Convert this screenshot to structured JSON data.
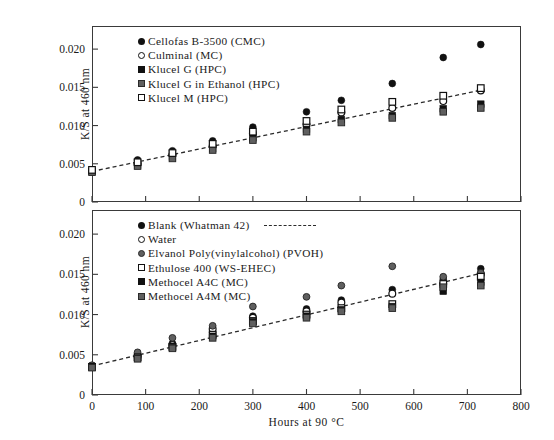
{
  "chart_data": [
    {
      "type": "scatter",
      "panel": "top",
      "title": "",
      "xlabel": "",
      "ylabel": "K/S at 460 nm",
      "xlim": [
        0,
        800
      ],
      "ylim": [
        0,
        0.0225
      ],
      "xticks": [
        0,
        100,
        200,
        300,
        400,
        500,
        600,
        700,
        800
      ],
      "xticklabels": [
        "0",
        "100",
        "200",
        "300",
        "400",
        "500",
        "600",
        "700",
        "800"
      ],
      "yticks": [
        0,
        0.005,
        0.01,
        0.015,
        0.02
      ],
      "yticklabels": [
        "0",
        "0.005",
        "0.010",
        "0.015",
        "0.020"
      ],
      "grid": false,
      "legend_position": "top-left",
      "trendline": {
        "style": "dashed",
        "x": [
          0,
          730
        ],
        "y": [
          0.004,
          0.0147
        ]
      },
      "x": [
        0,
        85,
        150,
        225,
        300,
        400,
        465,
        560,
        655,
        725
      ],
      "series": [
        {
          "name": "Cellofas B-3500 (CMC)",
          "marker": "filled-circle",
          "values": [
            0.0042,
            0.0055,
            0.0067,
            0.008,
            0.0098,
            0.0118,
            0.0133,
            0.0155,
            0.0189,
            0.0206
          ]
        },
        {
          "name": "Culminal (MC)",
          "marker": "open-circle",
          "values": [
            0.0041,
            0.005,
            0.0062,
            0.0073,
            0.009,
            0.0101,
            0.0117,
            0.0123,
            0.0132,
            0.0146
          ]
        },
        {
          "name": "Klucel G (HPC)",
          "marker": "filled-square",
          "values": [
            0.004,
            0.0048,
            0.0059,
            0.007,
            0.0084,
            0.0095,
            0.0108,
            0.0113,
            0.0122,
            0.0128
          ]
        },
        {
          "name": "Klucel G in Ethanol (HPC)",
          "marker": "gray-square",
          "values": [
            0.0039,
            0.0047,
            0.0057,
            0.0068,
            0.0081,
            0.0092,
            0.0104,
            0.011,
            0.0118,
            0.0123
          ]
        },
        {
          "name": "Klucel M (HPC)",
          "marker": "open-square",
          "values": [
            0.0042,
            0.0052,
            0.0064,
            0.0076,
            0.0092,
            0.0106,
            0.0121,
            0.0131,
            0.0139,
            0.0149
          ]
        }
      ],
      "legend": [
        {
          "label": "Cellofas B-3500 (CMC)",
          "marker": "filled-circle"
        },
        {
          "label": "Culminal (MC)",
          "marker": "open-circle"
        },
        {
          "label": "Klucel G (HPC)",
          "marker": "filled-square"
        },
        {
          "label": "Klucel G in Ethanol (HPC)",
          "marker": "gray-square"
        },
        {
          "label": "Klucel M (HPC)",
          "marker": "open-square"
        }
      ]
    },
    {
      "type": "scatter",
      "panel": "bottom",
      "title": "",
      "xlabel": "Hours at 90 °C",
      "ylabel": "K/S at 460 nm",
      "xlim": [
        0,
        800
      ],
      "ylim": [
        0,
        0.0225
      ],
      "xticks": [
        0,
        100,
        200,
        300,
        400,
        500,
        600,
        700,
        800
      ],
      "xticklabels": [
        "0",
        "100",
        "200",
        "300",
        "400",
        "500",
        "600",
        "700",
        "800"
      ],
      "yticks": [
        0,
        0.005,
        0.01,
        0.015,
        0.02
      ],
      "yticklabels": [
        "0",
        "0.005",
        "0.010",
        "0.015",
        "0.020"
      ],
      "grid": false,
      "legend_position": "top-left",
      "trendline": {
        "style": "dashed",
        "x": [
          0,
          730
        ],
        "y": [
          0.0036,
          0.0152
        ]
      },
      "x": [
        0,
        85,
        150,
        225,
        300,
        400,
        465,
        560,
        655,
        725
      ],
      "series": [
        {
          "name": "Blank (Whatman 42)",
          "marker": "filled-circle",
          "values": [
            0.0036,
            0.0049,
            0.0064,
            0.0078,
            0.0098,
            0.0107,
            0.0118,
            0.0131,
            0.0144,
            0.0157
          ]
        },
        {
          "name": "Water",
          "marker": "open-circle",
          "values": [
            0.0036,
            0.0048,
            0.0062,
            0.0082,
            0.0096,
            0.0104,
            0.0115,
            0.0126,
            0.0138,
            0.015
          ]
        },
        {
          "name": "Elvanol Poly(vinylalcohol) (PVOH)",
          "marker": "gray-circle",
          "values": [
            0.0037,
            0.0053,
            0.0071,
            0.0086,
            0.011,
            0.0122,
            0.0136,
            0.016,
            0.0147,
            0.0152
          ]
        },
        {
          "name": "Ethulose 400 (WS-EHEC)",
          "marker": "open-square",
          "values": [
            0.0035,
            0.0047,
            0.006,
            0.0075,
            0.0092,
            0.01,
            0.0108,
            0.0113,
            0.0138,
            0.0147
          ]
        },
        {
          "name": "Methocel A4C (MC)",
          "marker": "filled-square",
          "values": [
            0.0035,
            0.0046,
            0.0059,
            0.0073,
            0.0091,
            0.0098,
            0.0106,
            0.011,
            0.0129,
            0.014
          ]
        },
        {
          "name": "Methocel A4M (MC)",
          "marker": "gray-square",
          "values": [
            0.0034,
            0.0045,
            0.0058,
            0.0071,
            0.0089,
            0.0096,
            0.0104,
            0.0108,
            0.0134,
            0.0136
          ]
        }
      ],
      "legend": [
        {
          "label": "Blank (Whatman 42)",
          "marker": "filled-circle",
          "dash": true
        },
        {
          "label": "Water",
          "marker": "open-circle"
        },
        {
          "label": "Elvanol Poly(vinylalcohol) (PVOH)",
          "marker": "gray-circle"
        },
        {
          "label": "Ethulose 400 (WS-EHEC)",
          "marker": "open-square"
        },
        {
          "label": "Methocel A4C (MC)",
          "marker": "filled-square"
        },
        {
          "label": "Methocel A4M (MC)",
          "marker": "gray-square"
        }
      ]
    }
  ]
}
